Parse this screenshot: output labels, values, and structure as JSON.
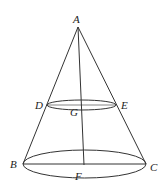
{
  "diagram": {
    "type": "truncated-cone-geometry",
    "points": {
      "A": {
        "label": "A",
        "x": 78,
        "y": 27,
        "lx": 73,
        "ly": 23
      },
      "D": {
        "label": "D",
        "x": 47,
        "y": 105,
        "lx": 35,
        "ly": 109
      },
      "E": {
        "label": "E",
        "x": 116,
        "y": 105,
        "lx": 122,
        "ly": 109
      },
      "G": {
        "label": "G",
        "lx": 70,
        "ly": 116
      },
      "B": {
        "label": "B",
        "x": 23,
        "y": 164,
        "lx": 10,
        "ly": 166
      },
      "C": {
        "label": "C",
        "x": 146,
        "y": 164,
        "lx": 150,
        "ly": 170
      },
      "F": {
        "label": "F",
        "lx": 75,
        "ly": 179
      }
    },
    "colors": {
      "line": "#333333",
      "text": "#222222",
      "background": "#ffffff"
    }
  }
}
